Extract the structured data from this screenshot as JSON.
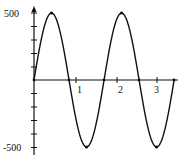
{
  "chart_data": {
    "type": "line",
    "title": "",
    "xlabel": "",
    "ylabel": "",
    "xlim": [
      0,
      3.5
    ],
    "ylim": [
      -500,
      500
    ],
    "x_ticks": [
      1,
      2,
      3
    ],
    "x_tick_labels": [
      "1",
      "2",
      "3"
    ],
    "y_tick_labels": [
      "500",
      "-500"
    ],
    "y_minor_tick_step": 100,
    "grid": false,
    "series": [
      {
        "name": "sinusoid",
        "amplitude": 500,
        "period": 1.73,
        "x": [
          0,
          0.43,
          0.865,
          1.3,
          1.73,
          2.16,
          2.595,
          3.03,
          3.46
        ],
        "y": [
          0,
          500,
          0,
          -500,
          0,
          500,
          0,
          -500,
          0
        ]
      }
    ],
    "markers": {
      "peaks": [
        [
          0.43,
          500
        ],
        [
          2.16,
          500
        ]
      ],
      "troughs": [
        [
          1.3,
          -500
        ],
        [
          3.03,
          -500
        ]
      ],
      "zero_crossings": [
        0,
        0.865,
        1.73,
        2.595,
        3.46
      ]
    }
  },
  "labels": {
    "y_top": "500",
    "y_bottom": "-500",
    "x1": "1",
    "x2": "2",
    "x3": "3"
  }
}
